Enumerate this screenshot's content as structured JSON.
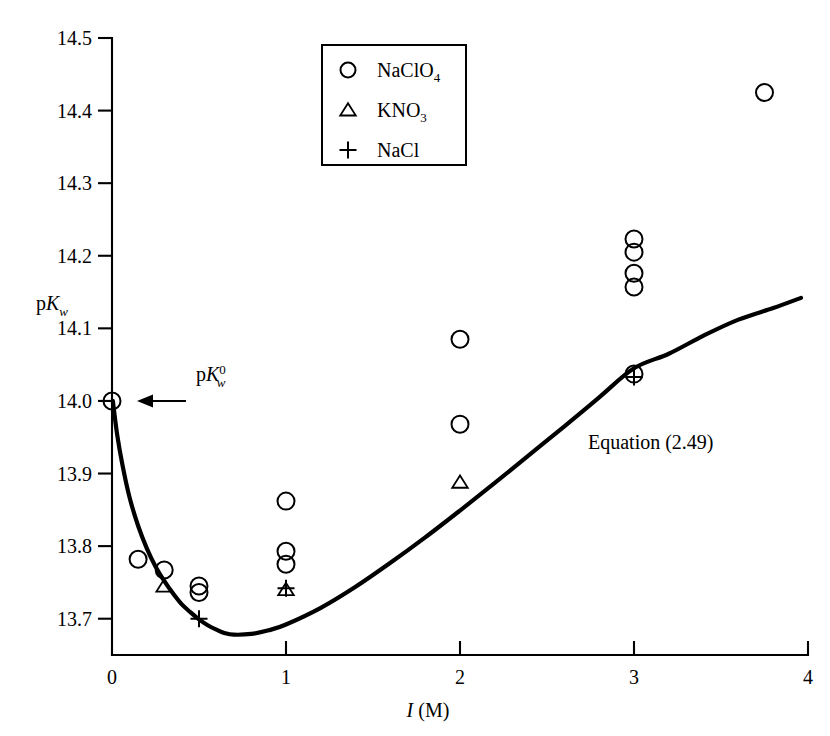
{
  "chart_data": {
    "type": "scatter",
    "title": "",
    "subtitle": "",
    "xlabel": "I (M)",
    "xlabel_parts": {
      "symbol": "I",
      "unit": "(M)"
    },
    "ylabel": "pKw",
    "ylabel_parts": {
      "prefix": "p",
      "symbol": "K",
      "subscript": "w"
    },
    "xlim": [
      0,
      4
    ],
    "ylim": [
      13.65,
      14.5
    ],
    "xticks": [
      0,
      1,
      2,
      3,
      4
    ],
    "xtick_labels": [
      "0",
      "1",
      "2",
      "3",
      "4"
    ],
    "yticks": [
      13.7,
      13.8,
      13.9,
      14.0,
      14.1,
      14.2,
      14.3,
      14.4,
      14.5
    ],
    "ytick_labels": [
      "13.7",
      "13.8",
      "13.9",
      "14.0",
      "14.1",
      "14.2",
      "14.3",
      "14.4",
      "14.5"
    ],
    "grid": false,
    "legend_position": "top-center",
    "series": [
      {
        "name": "NaClO4",
        "label": "NaClO",
        "label_subscript": "4",
        "marker": "circle",
        "points": [
          {
            "x": 0.0,
            "y": 14.0
          },
          {
            "x": 0.15,
            "y": 13.782
          },
          {
            "x": 0.3,
            "y": 13.767
          },
          {
            "x": 0.5,
            "y": 13.745
          },
          {
            "x": 0.5,
            "y": 13.736
          },
          {
            "x": 1.0,
            "y": 13.862
          },
          {
            "x": 1.0,
            "y": 13.793
          },
          {
            "x": 1.0,
            "y": 13.775
          },
          {
            "x": 2.0,
            "y": 14.085
          },
          {
            "x": 2.0,
            "y": 13.968
          },
          {
            "x": 3.0,
            "y": 14.223
          },
          {
            "x": 3.0,
            "y": 14.205
          },
          {
            "x": 3.0,
            "y": 14.176
          },
          {
            "x": 3.0,
            "y": 14.157
          },
          {
            "x": 3.0,
            "y": 14.037
          },
          {
            "x": 3.75,
            "y": 14.425
          }
        ]
      },
      {
        "name": "KNO3",
        "label": "KNO",
        "label_subscript": "3",
        "marker": "triangle",
        "points": [
          {
            "x": 0.3,
            "y": 13.745
          },
          {
            "x": 1.0,
            "y": 13.74
          },
          {
            "x": 2.0,
            "y": 13.888
          }
        ]
      },
      {
        "name": "NaCl",
        "label": "NaCl",
        "label_subscript": "",
        "marker": "plus",
        "points": [
          {
            "x": 0.5,
            "y": 13.7
          },
          {
            "x": 1.0,
            "y": 13.742
          },
          {
            "x": 3.0,
            "y": 14.033
          }
        ]
      }
    ],
    "curves": [
      {
        "name": "Equation (2.49)",
        "label": "Equation (2.49)",
        "style": "solid",
        "points": [
          {
            "x": 0.005,
            "y": 14.0
          },
          {
            "x": 0.03,
            "y": 13.953
          },
          {
            "x": 0.06,
            "y": 13.912
          },
          {
            "x": 0.1,
            "y": 13.868
          },
          {
            "x": 0.15,
            "y": 13.828
          },
          {
            "x": 0.2,
            "y": 13.797
          },
          {
            "x": 0.25,
            "y": 13.772
          },
          {
            "x": 0.3,
            "y": 13.752
          },
          {
            "x": 0.35,
            "y": 13.735
          },
          {
            "x": 0.4,
            "y": 13.72
          },
          {
            "x": 0.45,
            "y": 13.709
          },
          {
            "x": 0.5,
            "y": 13.699
          },
          {
            "x": 0.55,
            "y": 13.691
          },
          {
            "x": 0.6,
            "y": 13.685
          },
          {
            "x": 0.65,
            "y": 13.68
          },
          {
            "x": 0.7,
            "y": 13.678
          },
          {
            "x": 0.8,
            "y": 13.679
          },
          {
            "x": 0.9,
            "y": 13.684
          },
          {
            "x": 1.0,
            "y": 13.692
          },
          {
            "x": 1.2,
            "y": 13.715
          },
          {
            "x": 1.4,
            "y": 13.744
          },
          {
            "x": 1.6,
            "y": 13.777
          },
          {
            "x": 1.8,
            "y": 13.812
          },
          {
            "x": 2.0,
            "y": 13.849
          },
          {
            "x": 2.2,
            "y": 13.887
          },
          {
            "x": 2.4,
            "y": 13.926
          },
          {
            "x": 2.6,
            "y": 13.965
          },
          {
            "x": 2.8,
            "y": 14.005
          },
          {
            "x": 3.0,
            "y": 14.045
          },
          {
            "x": 3.2,
            "y": 14.065
          },
          {
            "x": 3.4,
            "y": 14.09
          },
          {
            "x": 3.6,
            "y": 14.112
          },
          {
            "x": 3.8,
            "y": 14.128
          },
          {
            "x": 3.96,
            "y": 14.142
          }
        ]
      }
    ],
    "annotations": [
      {
        "name": "pkw-zero-annotation",
        "text": "pKw0",
        "text_parts": {
          "prefix": "p",
          "symbol": "K",
          "subscript": "w",
          "superscript": "0"
        },
        "target": {
          "x": 0.0,
          "y": 14.0
        },
        "arrow": true
      }
    ]
  },
  "legend": {
    "entries": [
      {
        "marker": "circle",
        "label": "NaClO",
        "sub": "4"
      },
      {
        "marker": "triangle",
        "label": "KNO",
        "sub": "3"
      },
      {
        "marker": "plus",
        "label": "NaCl",
        "sub": ""
      }
    ]
  },
  "colors": {
    "ink": "#000000",
    "background": "#ffffff"
  }
}
